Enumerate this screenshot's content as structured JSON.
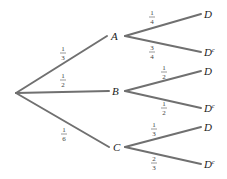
{
  "diagram": {
    "type": "probability-tree",
    "first_level": [
      {
        "label": "A",
        "probability": {
          "num": "1",
          "den": "3"
        }
      },
      {
        "label": "B",
        "probability": {
          "num": "1",
          "den": "2"
        }
      },
      {
        "label": "C",
        "probability": {
          "num": "1",
          "den": "6"
        }
      }
    ],
    "second_level": {
      "A": [
        {
          "label": "D",
          "sup": "",
          "probability": {
            "num": "1",
            "den": "4"
          }
        },
        {
          "label": "D",
          "sup": "c",
          "probability": {
            "num": "3",
            "den": "4"
          }
        }
      ],
      "B": [
        {
          "label": "D",
          "sup": "",
          "probability": {
            "num": "1",
            "den": "2"
          }
        },
        {
          "label": "D",
          "sup": "c",
          "probability": {
            "num": "1",
            "den": "2"
          }
        }
      ],
      "C": [
        {
          "label": "D",
          "sup": "",
          "probability": {
            "num": "1",
            "den": "3"
          }
        },
        {
          "label": "D",
          "sup": "c",
          "probability": {
            "num": "2",
            "den": "3"
          }
        }
      ]
    }
  }
}
